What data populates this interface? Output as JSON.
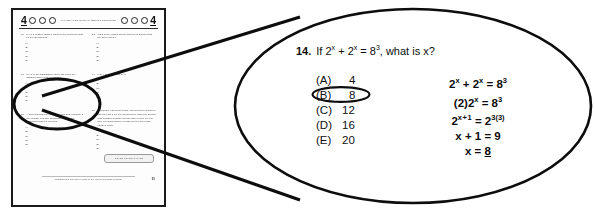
{
  "colors": {
    "ink": "#0d0d0d",
    "page_border": "#1a1a1a",
    "page_background": "#fdfdfd",
    "canvas_background": "#ffffff",
    "scan_text": "#4a4a4a"
  },
  "test_page": {
    "section_header": {
      "left_number": "4",
      "right_number": "4",
      "title": "MATHEMATICS LEVEL IC TESTING CONTINUED",
      "circle_count_left": 3,
      "circle_count_right": 3
    },
    "questions": [
      {
        "number": "11.",
        "text": "If x is a positive integer, which of the following must be an odd integer?",
        "choices": [
          "(A)",
          "(B)",
          "(C)",
          "(D)",
          "(E)"
        ]
      },
      {
        "number": "13.",
        "text": "If x is in the highlighted region, the value of x satisfies which of the following?",
        "choices": [
          "(A)",
          "(B)",
          "(C)",
          "(D)",
          "(E)"
        ]
      },
      {
        "number": "15.",
        "text": "A bag contains only red, white, and blue marbles. If one marble is drawn at random, what is the probability that it is not red?",
        "choices": [
          "(A)",
          "(B)",
          "(C)",
          "(D)",
          "(E)"
        ]
      },
      {
        "number": "12.",
        "text": "What is the largest integer that is not greater than the given value?",
        "choices": [
          "(A)",
          "(B)",
          "(C)",
          "(D)",
          "(E)"
        ]
      },
      {
        "number": "14.",
        "text": "If 2x + 2x = 83, what is x?",
        "choices": [
          "(A)",
          "(B)",
          "(C)",
          "(D)",
          "(E)"
        ]
      },
      {
        "number": "16.",
        "text": "A company offers two plans. The first plan charges a flat rate plus a fee per unit shipped, while the second plan charges a higher flat rate with a lower fee per unit. For what number of units are the two plans equal in cost?",
        "choices": [
          "(A)",
          "(B)",
          "(C)",
          "(D)",
          "(E)"
        ]
      }
    ],
    "go_on_label": "GO ON TO NEXT PAGE",
    "footer_text": "Unauthorized copying or reuse of any part of this page is illegal.",
    "page_number": "51"
  },
  "magnified": {
    "question_number": "14.",
    "question_text_pre": "If 2",
    "question_exp1": "x",
    "question_mid": " + 2",
    "question_exp2": "x",
    "question_eq": " = 8",
    "question_exp3": "3",
    "question_text_post": ", what is x?",
    "choices": [
      {
        "letter": "(A)",
        "value": "4",
        "circled": false
      },
      {
        "letter": "(B)",
        "value": "8",
        "circled": true
      },
      {
        "letter": "(C)",
        "value": "12",
        "circled": false
      },
      {
        "letter": "(D)",
        "value": "16",
        "circled": false
      },
      {
        "letter": "(E)",
        "value": "20",
        "circled": false
      }
    ],
    "work_lines": [
      "2ˣ + 2ˣ = 8³",
      "(2)2ˣ = 8³",
      "2ˣ⁺¹ = 2³⁽³⁾",
      "x + 1 = 9",
      "x = 8"
    ],
    "answer_value": "8"
  }
}
